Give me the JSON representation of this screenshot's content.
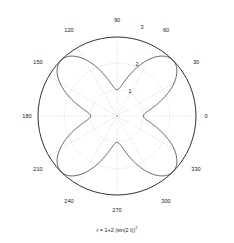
{
  "figure": {
    "caption_prefix": "r = 1+2 (sin(2 t))",
    "caption_exponent": "2",
    "caption_full": "r = 1+2 (sin(2 t))^2",
    "background_color": "#ffffff",
    "curve_color": "#2b2b2b",
    "grid_color": "#9a9a9a",
    "axis_color": "#1a1a1a"
  },
  "chart_data": {
    "type": "line",
    "projection": "polar",
    "title": "",
    "subtitle": "",
    "annotation": "r = 1+2 (sin(2 t))^2",
    "equation": "r = 1 + 2*sin(2*theta)^2",
    "xlabel": "",
    "ylabel": "",
    "grid": true,
    "legend": false,
    "angle_unit": "degrees",
    "angle_direction": "counterclockwise",
    "angle_zero_location": "E",
    "angle_tick_labels": [
      "0",
      "30",
      "60",
      "90",
      "120",
      "150",
      "180",
      "210",
      "240",
      "270",
      "300",
      "330"
    ],
    "angle_ticks": [
      0,
      30,
      60,
      90,
      120,
      150,
      180,
      210,
      240,
      270,
      300,
      330
    ],
    "radial_tick_labels": [
      "1",
      "2",
      "3"
    ],
    "radial_ticks": [
      1,
      2,
      3
    ],
    "rlim": [
      0,
      3
    ],
    "series": [
      {
        "name": "r = 1+2 (sin(2 t))^2",
        "theta": [
          0,
          10,
          20,
          30,
          40,
          45,
          50,
          60,
          70,
          80,
          90,
          100,
          110,
          120,
          130,
          135,
          140,
          150,
          160,
          170,
          180,
          190,
          200,
          210,
          220,
          225,
          230,
          240,
          250,
          260,
          270,
          280,
          290,
          300,
          310,
          315,
          320,
          330,
          340,
          350,
          360
        ],
        "r": [
          1.0,
          1.23,
          1.74,
          2.5,
          2.94,
          3.0,
          2.94,
          2.5,
          1.74,
          1.23,
          1.0,
          1.23,
          1.74,
          2.5,
          2.94,
          3.0,
          2.94,
          2.5,
          1.74,
          1.23,
          1.0,
          1.23,
          1.74,
          2.5,
          2.94,
          3.0,
          2.94,
          2.5,
          1.74,
          1.23,
          1.0,
          1.23,
          1.74,
          2.5,
          2.94,
          3.0,
          2.94,
          2.5,
          1.74,
          1.23,
          1.0
        ],
        "r_min": 1,
        "r_max": 3,
        "petals": 4,
        "petal_peak_angles": [
          45,
          135,
          225,
          315
        ],
        "petal_min_angles": [
          0,
          90,
          180,
          270
        ]
      }
    ]
  },
  "labels": {
    "angles": [
      {
        "text": "0",
        "deg": 0
      },
      {
        "text": "30",
        "deg": 30
      },
      {
        "text": "60",
        "deg": 60
      },
      {
        "text": "90",
        "deg": 90
      },
      {
        "text": "120",
        "deg": 120
      },
      {
        "text": "150",
        "deg": 150
      },
      {
        "text": "180",
        "deg": 180
      },
      {
        "text": "210",
        "deg": 210
      },
      {
        "text": "240",
        "deg": 240
      },
      {
        "text": "270",
        "deg": 270
      },
      {
        "text": "300",
        "deg": 300
      },
      {
        "text": "330",
        "deg": 330
      }
    ],
    "radial": [
      {
        "text": "1",
        "r": 1
      },
      {
        "text": "2",
        "r": 2
      },
      {
        "text": "3",
        "r": 3
      }
    ]
  }
}
